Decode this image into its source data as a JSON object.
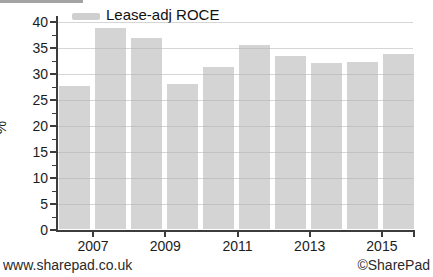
{
  "page": {
    "background_color": "#ffffff"
  },
  "legend": {
    "label": "Lease-adj ROCE",
    "swatch_color": "#cfcfcf"
  },
  "footer": {
    "left": "www.sharepad.co.uk",
    "right": "©SharePad"
  },
  "chart_data": {
    "type": "bar",
    "title": "",
    "series_name": "Lease-adj ROCE",
    "categories": [
      "2006",
      "2007",
      "2008",
      "2009",
      "2010",
      "2011",
      "2012",
      "2013",
      "2014",
      "2015"
    ],
    "values": [
      27.6,
      38.8,
      36.8,
      28.0,
      31.3,
      35.4,
      33.4,
      32.0,
      32.2,
      33.8
    ],
    "xlabel": "",
    "ylabel": "%",
    "ylim": [
      0,
      40
    ],
    "y_major_step": 5,
    "y_minor_step": 2.5,
    "y_tick_labels": [
      "0",
      "5",
      "10",
      "15",
      "20",
      "25",
      "30",
      "35",
      "40"
    ],
    "x_tick_labels": [
      "2007",
      "2009",
      "2011",
      "2013",
      "2015"
    ],
    "grid": true,
    "legend_position": "top-left",
    "bar_color": "#d4d4d4",
    "gridline_color": "#c8c8c8",
    "axis_color": "#3c3c3c"
  }
}
